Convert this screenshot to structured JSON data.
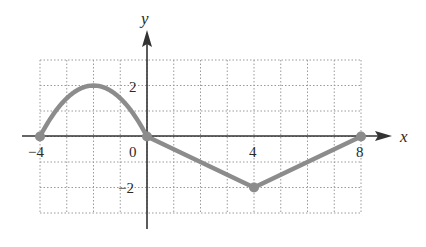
{
  "chart_data": {
    "type": "line",
    "title": "",
    "xlabel": "x",
    "ylabel": "y",
    "xlim": [
      -4,
      8
    ],
    "ylim": [
      -3,
      3
    ],
    "grid": true,
    "grid_step": {
      "x": 1,
      "y": 1
    },
    "x_tick_labels": [
      {
        "value": -4,
        "label": "−4"
      },
      {
        "value": 0,
        "label": "0"
      },
      {
        "value": 4,
        "label": "4"
      },
      {
        "value": 8,
        "label": "8"
      }
    ],
    "y_tick_labels": [
      {
        "value": 2,
        "label": "2"
      },
      {
        "value": -2,
        "label": "−2"
      }
    ],
    "series": [
      {
        "name": "f(x)",
        "segments": [
          {
            "kind": "parabola",
            "description": "y = 2 - (x+2)^2/2 on [-4, 0]",
            "x": [
              -4,
              -3,
              -2,
              -1,
              0
            ],
            "y": [
              0,
              1.5,
              2,
              1.5,
              0
            ]
          },
          {
            "kind": "linear",
            "x": [
              0,
              4
            ],
            "y": [
              0,
              -2
            ]
          },
          {
            "kind": "linear",
            "x": [
              4,
              8
            ],
            "y": [
              -2,
              0
            ]
          }
        ],
        "points": [
          {
            "x": -4,
            "y": 0
          },
          {
            "x": 0,
            "y": 0
          },
          {
            "x": 4,
            "y": -2
          },
          {
            "x": 8,
            "y": 0
          }
        ],
        "color": "#8c8c8c"
      }
    ]
  },
  "colors": {
    "curve": "#8c8c8c",
    "axis": "#333333",
    "grid": "#9a9a9a"
  }
}
